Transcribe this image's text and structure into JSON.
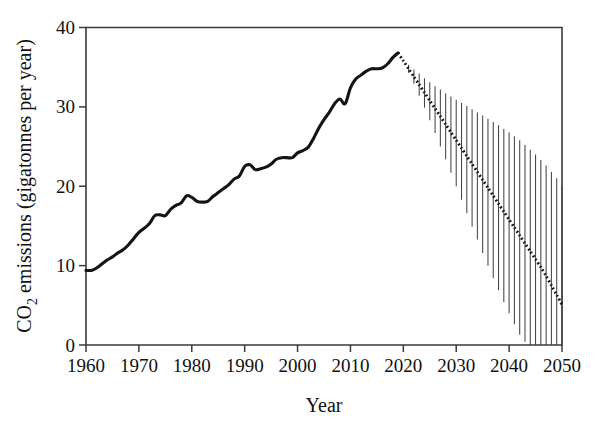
{
  "chart_data": {
    "type": "line",
    "title": "",
    "xlabel": "Year",
    "ylabel": "CO2 emissions (gigatonnes per year)",
    "ylabel_main": "CO",
    "ylabel_sub": "2",
    "ylabel_rest": " emissions (gigatonnes per year)",
    "xlim": [
      1960,
      2050
    ],
    "ylim": [
      0,
      40
    ],
    "grid": false,
    "legend": "none",
    "xticks": [
      1960,
      1970,
      1980,
      1990,
      2000,
      2010,
      2020,
      2030,
      2040,
      2050
    ],
    "xtick_labels": [
      "1960",
      "1970",
      "1980",
      "1990",
      "2000",
      "2010",
      "2020",
      "2030",
      "2040",
      "2050"
    ],
    "yticks": [
      0,
      10,
      20,
      30,
      40
    ],
    "ytick_labels": [
      "0",
      "10",
      "20",
      "30",
      "40"
    ],
    "series": [
      {
        "name": "Historical CO2 emissions",
        "style": "solid",
        "x": [
          1960,
          1961,
          1962,
          1963,
          1964,
          1965,
          1966,
          1967,
          1968,
          1969,
          1970,
          1971,
          1972,
          1973,
          1974,
          1975,
          1976,
          1977,
          1978,
          1979,
          1980,
          1981,
          1982,
          1983,
          1984,
          1985,
          1986,
          1987,
          1988,
          1989,
          1990,
          1991,
          1992,
          1993,
          1994,
          1995,
          1996,
          1997,
          1998,
          1999,
          2000,
          2001,
          2002,
          2003,
          2004,
          2005,
          2006,
          2007,
          2008,
          2009,
          2010,
          2011,
          2012,
          2013,
          2014,
          2015,
          2016,
          2017,
          2018,
          2019
        ],
        "values": [
          9.4,
          9.4,
          9.7,
          10.2,
          10.7,
          11.1,
          11.6,
          12.0,
          12.6,
          13.4,
          14.2,
          14.7,
          15.3,
          16.3,
          16.4,
          16.3,
          17.1,
          17.6,
          17.9,
          18.8,
          18.6,
          18.1,
          18.0,
          18.1,
          18.7,
          19.2,
          19.7,
          20.2,
          20.9,
          21.3,
          22.5,
          22.7,
          22.1,
          22.2,
          22.4,
          22.8,
          23.4,
          23.6,
          23.6,
          23.6,
          24.2,
          24.5,
          24.9,
          26.0,
          27.3,
          28.4,
          29.3,
          30.4,
          31.0,
          30.4,
          32.4,
          33.5,
          34.0,
          34.5,
          34.8,
          34.8,
          34.9,
          35.4,
          36.2,
          36.8
        ]
      },
      {
        "name": "Projected CO2 emissions (pathway)",
        "style": "dotted",
        "x": [
          2019,
          2020,
          2021,
          2022,
          2023,
          2024,
          2025,
          2026,
          2027,
          2028,
          2029,
          2030,
          2031,
          2032,
          2033,
          2034,
          2035,
          2036,
          2037,
          2038,
          2039,
          2040,
          2041,
          2042,
          2043,
          2044,
          2045,
          2046,
          2047,
          2048,
          2049,
          2050
        ],
        "values": [
          36.8,
          35.8,
          34.8,
          33.8,
          32.8,
          31.8,
          30.8,
          29.8,
          28.8,
          27.8,
          26.8,
          25.8,
          24.8,
          23.8,
          22.8,
          21.8,
          20.8,
          19.8,
          18.8,
          17.8,
          16.8,
          15.8,
          14.8,
          13.8,
          12.8,
          11.8,
          10.8,
          9.8,
          8.7,
          7.5,
          6.3,
          5.1
        ],
        "uncertainty_low": [
          36.8,
          35.6,
          34.3,
          32.9,
          31.4,
          29.9,
          28.3,
          26.7,
          25.0,
          23.4,
          21.7,
          20.0,
          18.3,
          16.6,
          14.9,
          13.3,
          11.6,
          10.0,
          8.4,
          6.9,
          5.4,
          4.0,
          2.6,
          1.3,
          0.4,
          0.0,
          0.0,
          0.0,
          0.0,
          0.0,
          0.0,
          0.0
        ],
        "uncertainty_high": [
          36.8,
          36.0,
          35.3,
          34.7,
          34.2,
          33.6,
          33.1,
          32.6,
          32.2,
          31.7,
          31.3,
          30.9,
          30.5,
          30.1,
          29.7,
          29.3,
          28.9,
          28.5,
          28.1,
          27.7,
          27.2,
          26.8,
          26.3,
          25.8,
          25.2,
          24.6,
          24.0,
          23.3,
          22.6,
          21.8,
          21.0,
          20.1
        ]
      }
    ],
    "annotations": []
  },
  "colors": {
    "line": "#141414",
    "axis": "#3a3a3a",
    "errorbar": "#444444",
    "background": "#ffffff"
  }
}
